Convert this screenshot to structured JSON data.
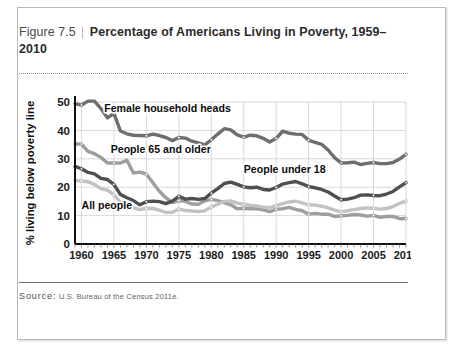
{
  "figure": {
    "label": "Figure 7.5",
    "title": "Percentage of Americans Living in Poverty, 1959–2010",
    "source_label": "Source:",
    "source_text": "U.S. Bureau of the Census 2011e."
  },
  "chart_data": {
    "type": "line",
    "xlabel": "",
    "ylabel": "% living below poverty line",
    "xlim": [
      1959,
      2010
    ],
    "ylim": [
      0,
      50
    ],
    "yticks": [
      0,
      10,
      20,
      30,
      40,
      50
    ],
    "xticks": [
      1960,
      1965,
      1970,
      1975,
      1980,
      1985,
      1990,
      1995,
      2000,
      2005,
      2010
    ],
    "grid": true,
    "legend_position": "inline-labels",
    "x": [
      1959,
      1960,
      1961,
      1962,
      1963,
      1964,
      1965,
      1966,
      1967,
      1968,
      1969,
      1970,
      1971,
      1972,
      1973,
      1974,
      1975,
      1976,
      1977,
      1978,
      1979,
      1980,
      1981,
      1982,
      1983,
      1984,
      1985,
      1986,
      1987,
      1988,
      1989,
      1990,
      1991,
      1992,
      1993,
      1994,
      1995,
      1996,
      1997,
      1998,
      1999,
      2000,
      2001,
      2002,
      2003,
      2004,
      2005,
      2006,
      2007,
      2008,
      2009,
      2010
    ],
    "series": [
      {
        "name": "Female household heads",
        "color": "#6e6e6e",
        "values": [
          49.4,
          48.9,
          50.3,
          50.3,
          47.7,
          44.4,
          46.0,
          39.8,
          38.8,
          38.3,
          38.2,
          38.1,
          38.7,
          38.2,
          37.5,
          36.4,
          37.5,
          37.3,
          36.2,
          35.6,
          34.9,
          36.7,
          38.7,
          40.6,
          40.2,
          38.4,
          37.6,
          38.3,
          38.1,
          37.2,
          35.9,
          37.2,
          39.7,
          39.0,
          38.7,
          38.6,
          36.5,
          35.8,
          35.1,
          33.1,
          30.4,
          28.5,
          28.6,
          28.8,
          28.0,
          28.4,
          28.7,
          28.3,
          28.3,
          28.7,
          29.9,
          31.6
        ]
      },
      {
        "name": "People 65 and older",
        "color": "#9e9e9e",
        "values": [
          35.2,
          35.2,
          32.6,
          31.8,
          30.5,
          28.5,
          28.5,
          28.5,
          29.5,
          25.0,
          25.3,
          24.6,
          21.6,
          18.6,
          16.3,
          14.6,
          15.3,
          15.0,
          14.1,
          14.0,
          15.2,
          15.7,
          15.3,
          14.6,
          13.8,
          12.4,
          12.6,
          12.4,
          12.5,
          12.0,
          11.4,
          12.2,
          12.4,
          12.9,
          12.2,
          11.7,
          10.5,
          10.8,
          10.5,
          10.5,
          9.7,
          9.9,
          10.1,
          10.4,
          10.2,
          9.8,
          10.1,
          9.4,
          9.7,
          9.7,
          8.9,
          9.0
        ]
      },
      {
        "name": "People under 18",
        "color": "#4f4f4f",
        "values": [
          27.3,
          26.5,
          25.2,
          24.7,
          23.1,
          22.7,
          21.0,
          17.4,
          16.3,
          15.3,
          13.8,
          14.9,
          15.1,
          14.9,
          14.2,
          15.1,
          16.8,
          15.8,
          16.0,
          15.7,
          16.0,
          17.9,
          19.5,
          21.3,
          21.8,
          21.0,
          20.1,
          19.8,
          20.0,
          19.2,
          19.0,
          19.9,
          21.1,
          21.6,
          22.0,
          21.2,
          20.2,
          19.8,
          19.2,
          18.3,
          16.9,
          15.6,
          15.8,
          16.3,
          17.2,
          17.3,
          17.1,
          17.0,
          17.6,
          18.5,
          20.1,
          21.6
        ]
      },
      {
        "name": "All people",
        "color": "#c2c2c2",
        "values": [
          22.4,
          22.2,
          21.9,
          21.0,
          19.5,
          19.0,
          17.3,
          14.7,
          14.2,
          12.8,
          12.1,
          12.6,
          12.5,
          11.9,
          11.1,
          11.2,
          12.3,
          11.8,
          11.6,
          11.4,
          11.7,
          13.0,
          14.0,
          15.0,
          15.2,
          14.4,
          14.0,
          13.6,
          13.4,
          13.0,
          12.8,
          13.5,
          14.2,
          14.8,
          15.1,
          14.5,
          13.8,
          13.7,
          13.3,
          12.7,
          11.9,
          11.3,
          11.7,
          12.1,
          12.5,
          12.7,
          12.6,
          12.3,
          12.5,
          13.2,
          14.3,
          15.1
        ]
      }
    ],
    "inline_labels": [
      {
        "text": "Female household heads",
        "x": 1963.5,
        "y": 46.5
      },
      {
        "text": "People 65 and older",
        "x": 1964.5,
        "y": 32.0
      },
      {
        "text": "People under 18",
        "x": 1985.0,
        "y": 25.0
      },
      {
        "text": "All people",
        "x": 1960.0,
        "y": 12.3
      }
    ]
  },
  "axis": {
    "y_title": "% living below poverty line",
    "y_ticks": [
      "0",
      "10",
      "20",
      "30",
      "40",
      "50"
    ],
    "x_ticks": [
      "1960",
      "1965",
      "1970",
      "1975",
      "1980",
      "1985",
      "1990",
      "1995",
      "2000",
      "2005",
      "2010"
    ]
  }
}
